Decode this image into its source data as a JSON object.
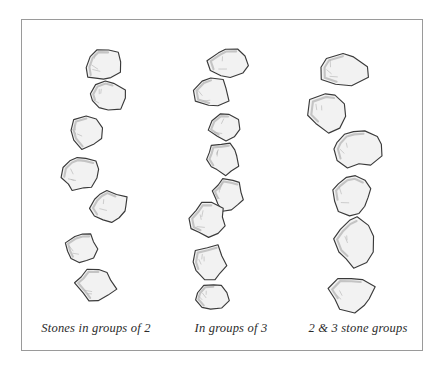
{
  "figure": {
    "medium": "pen-and-ink hand drawing",
    "background_color": "#ffffff",
    "frame": {
      "border_color": "#9a9a9a",
      "border_width_px": 1,
      "x": 21,
      "y": 19,
      "width": 402,
      "height": 332
    },
    "stone_style": {
      "outline_color": "#3a3a3a",
      "fill_color": "#f2f2f2",
      "shadow_color": "#9e9e9e",
      "hatch_color": "#b4b4b4"
    }
  },
  "columns": [
    {
      "id": "column-1",
      "caption": "Stones in groups of 2",
      "stone_count": 7,
      "grouping": 2,
      "stones": [
        {
          "cx": 83,
          "cy": 44,
          "rx": 21,
          "ry": 19,
          "rot": -8,
          "seed": 1
        },
        {
          "cx": 85,
          "cy": 76,
          "rx": 20,
          "ry": 18,
          "rot": 12,
          "seed": 2
        },
        {
          "cx": 65,
          "cy": 111,
          "rx": 21,
          "ry": 18,
          "rot": -14,
          "seed": 3
        },
        {
          "cx": 58,
          "cy": 153,
          "rx": 19,
          "ry": 19,
          "rot": 20,
          "seed": 4
        },
        {
          "cx": 88,
          "cy": 186,
          "rx": 21,
          "ry": 17,
          "rot": -5,
          "seed": 5
        },
        {
          "cx": 60,
          "cy": 228,
          "rx": 17,
          "ry": 16,
          "rot": 6,
          "seed": 6
        },
        {
          "cx": 74,
          "cy": 264,
          "rx": 20,
          "ry": 19,
          "rot": -18,
          "seed": 7
        }
      ]
    },
    {
      "id": "column-2",
      "caption": "In groups of 3",
      "stone_count": 8,
      "grouping": 3,
      "stones": [
        {
          "cx": 207,
          "cy": 43,
          "rx": 21,
          "ry": 17,
          "rot": 10,
          "seed": 8
        },
        {
          "cx": 190,
          "cy": 72,
          "rx": 19,
          "ry": 17,
          "rot": -12,
          "seed": 9
        },
        {
          "cx": 203,
          "cy": 107,
          "rx": 16,
          "ry": 16,
          "rot": 8,
          "seed": 10
        },
        {
          "cx": 201,
          "cy": 138,
          "rx": 18,
          "ry": 17,
          "rot": -6,
          "seed": 11
        },
        {
          "cx": 206,
          "cy": 175,
          "rx": 17,
          "ry": 17,
          "rot": 15,
          "seed": 12
        },
        {
          "cx": 186,
          "cy": 200,
          "rx": 19,
          "ry": 18,
          "rot": -10,
          "seed": 13
        },
        {
          "cx": 188,
          "cy": 243,
          "rx": 18,
          "ry": 19,
          "rot": 5,
          "seed": 14
        },
        {
          "cx": 190,
          "cy": 276,
          "rx": 20,
          "ry": 15,
          "rot": -16,
          "seed": 15
        }
      ]
    },
    {
      "id": "column-3",
      "caption": "2 & 3 stone groups",
      "stone_count": 6,
      "grouping": "2 and 3",
      "stones": [
        {
          "cx": 320,
          "cy": 49,
          "rx": 27,
          "ry": 19,
          "rot": -12,
          "seed": 16
        },
        {
          "cx": 307,
          "cy": 92,
          "rx": 22,
          "ry": 22,
          "rot": 14,
          "seed": 17
        },
        {
          "cx": 335,
          "cy": 128,
          "rx": 26,
          "ry": 21,
          "rot": -7,
          "seed": 18
        },
        {
          "cx": 330,
          "cy": 174,
          "rx": 21,
          "ry": 21,
          "rot": 9,
          "seed": 19
        },
        {
          "cx": 332,
          "cy": 222,
          "rx": 21,
          "ry": 26,
          "rot": -11,
          "seed": 20
        },
        {
          "cx": 330,
          "cy": 274,
          "rx": 23,
          "ry": 19,
          "rot": 16,
          "seed": 21
        }
      ]
    }
  ]
}
